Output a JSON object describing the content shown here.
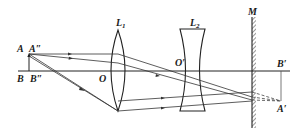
{
  "diagram": {
    "labels": {
      "A": "A",
      "A_dbl": "A″",
      "B": "B",
      "B_dbl": "B″",
      "O": "O",
      "O_prime": "O′",
      "L1_main": "L",
      "L1_sub": "1",
      "L2_main": "L",
      "L2_sub": "2",
      "M": "M",
      "B_prime": "B′",
      "A_prime": "A′"
    },
    "elements": [
      {
        "id": "object",
        "type": "arrow",
        "from": "B″",
        "to": "A″"
      },
      {
        "id": "L1",
        "type": "converging-lens",
        "center": "O"
      },
      {
        "id": "L2",
        "type": "diverging-lens",
        "center": "O′"
      },
      {
        "id": "M",
        "type": "plane-mirror"
      },
      {
        "id": "image",
        "type": "virtual-image-arrow",
        "from": "B′",
        "to": "A′"
      }
    ],
    "colors": {
      "line": "#222222",
      "background": "#ffffff"
    }
  }
}
